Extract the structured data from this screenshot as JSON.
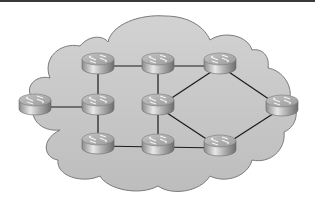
{
  "diagram": {
    "type": "network-topology",
    "background": "#ffffff",
    "cloud": {
      "fill": "#c8c8c8",
      "stroke": "#7a7a7a"
    },
    "link_color": "#1a1a1a",
    "routers": [
      {
        "id": "R1",
        "name": "router-top-left",
        "x": 98,
        "y": 66
      },
      {
        "id": "R2",
        "name": "router-top-middle",
        "x": 158,
        "y": 66
      },
      {
        "id": "R3",
        "name": "router-top-right",
        "x": 220,
        "y": 66
      },
      {
        "id": "R4",
        "name": "router-far-left",
        "x": 35,
        "y": 107
      },
      {
        "id": "R5",
        "name": "router-middle-left",
        "x": 98,
        "y": 107
      },
      {
        "id": "R6",
        "name": "router-center",
        "x": 158,
        "y": 107
      },
      {
        "id": "R7",
        "name": "router-far-right",
        "x": 282,
        "y": 108
      },
      {
        "id": "R8",
        "name": "router-bottom-left",
        "x": 98,
        "y": 146
      },
      {
        "id": "R9",
        "name": "router-bottom-middle",
        "x": 158,
        "y": 147
      },
      {
        "id": "R10",
        "name": "router-bottom-right",
        "x": 220,
        "y": 148
      }
    ],
    "links": [
      [
        "R1",
        "R2"
      ],
      [
        "R2",
        "R3"
      ],
      [
        "R1",
        "R5"
      ],
      [
        "R2",
        "R6"
      ],
      [
        "R4",
        "R5"
      ],
      [
        "R5",
        "R8"
      ],
      [
        "R6",
        "R9"
      ],
      [
        "R8",
        "R9"
      ],
      [
        "R9",
        "R10"
      ],
      [
        "R6",
        "R3"
      ],
      [
        "R6",
        "R10"
      ],
      [
        "R3",
        "R7"
      ],
      [
        "R7",
        "R10"
      ]
    ]
  }
}
